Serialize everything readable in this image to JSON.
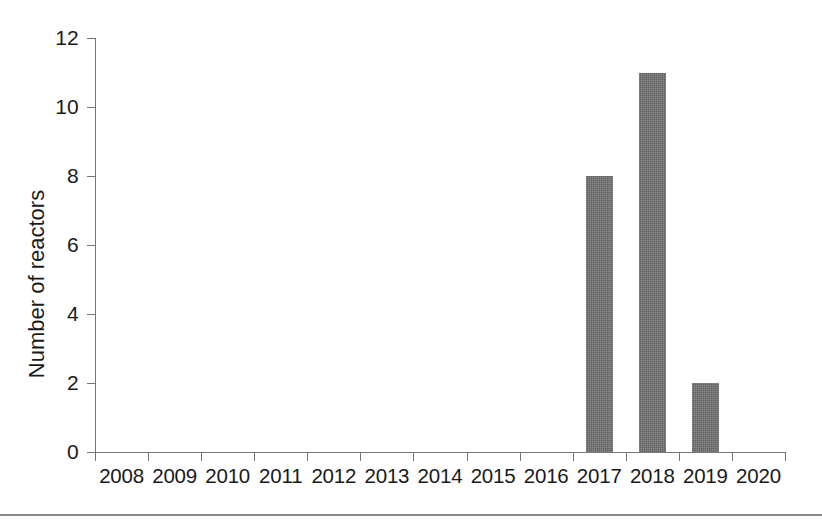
{
  "figure": {
    "background_color": "#ffffff",
    "bottom_rule_color": "#8a8a8a"
  },
  "chart_data": {
    "type": "bar",
    "title": "",
    "subtitle": "",
    "xlabel": "",
    "ylabel": "Number of reactors",
    "categories": [
      "2008",
      "2009",
      "2010",
      "2011",
      "2012",
      "2013",
      "2014",
      "2015",
      "2016",
      "2017",
      "2018",
      "2019",
      "2020"
    ],
    "values": [
      0,
      0,
      0,
      0,
      0,
      0,
      0,
      0,
      0,
      8,
      11,
      2,
      0
    ],
    "series": [
      {
        "name": "Number of reactors",
        "values": [
          0,
          0,
          0,
          0,
          0,
          0,
          0,
          0,
          0,
          8,
          11,
          2,
          0
        ],
        "color": "#6e6e6e"
      }
    ],
    "ylim": [
      0,
      12
    ],
    "yticks": [
      0,
      2,
      4,
      6,
      8,
      10,
      12
    ],
    "ytick_labels": [
      "0",
      "2",
      "4",
      "6",
      "8",
      "10",
      "12"
    ],
    "xtick_labels": [
      "2008",
      "2009",
      "2010",
      "2011",
      "2012",
      "2013",
      "2014",
      "2015",
      "2016",
      "2017",
      "2018",
      "2019",
      "2020"
    ],
    "grid": false,
    "legend": null,
    "legend_position": "none",
    "bar_color": "#6e6e6e",
    "axis_color": "#767676",
    "annotations": []
  }
}
